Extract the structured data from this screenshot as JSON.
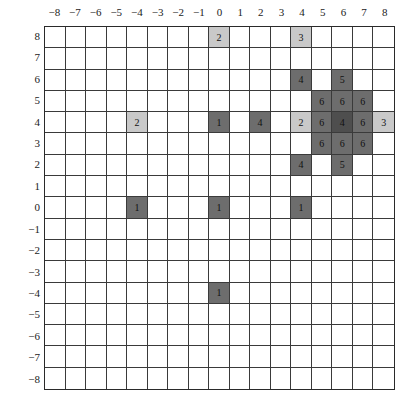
{
  "x_axis": {
    "ticks": [
      "−8",
      "−7",
      "−6",
      "−5",
      "−4",
      "−3",
      "−2",
      "−1",
      "0",
      "1",
      "2",
      "3",
      "4",
      "5",
      "6",
      "7",
      "8"
    ]
  },
  "y_axis": {
    "ticks": [
      "8",
      "7",
      "6",
      "5",
      "4",
      "3",
      "2",
      "1",
      "0",
      "−1",
      "−2",
      "−3",
      "−4",
      "−5",
      "−6",
      "−7",
      "−8"
    ]
  },
  "colors": {
    "light": "#c9c9c9",
    "dark": "#6d6d6d",
    "darker": "#4e4e4e",
    "empty": "#ffffff",
    "grid": "#3a3a3a"
  },
  "cells": [
    {
      "x": 0,
      "y": 8,
      "value": "2",
      "shade": "light"
    },
    {
      "x": 4,
      "y": 8,
      "value": "3",
      "shade": "light"
    },
    {
      "x": 4,
      "y": 6,
      "value": "4",
      "shade": "dark"
    },
    {
      "x": 6,
      "y": 6,
      "value": "5",
      "shade": "dark"
    },
    {
      "x": 5,
      "y": 5,
      "value": "6",
      "shade": "dark"
    },
    {
      "x": 6,
      "y": 5,
      "value": "6",
      "shade": "dark"
    },
    {
      "x": 7,
      "y": 5,
      "value": "6",
      "shade": "dark"
    },
    {
      "x": -4,
      "y": 4,
      "value": "2",
      "shade": "light"
    },
    {
      "x": 0,
      "y": 4,
      "value": "1",
      "shade": "dark"
    },
    {
      "x": 2,
      "y": 4,
      "value": "4",
      "shade": "dark"
    },
    {
      "x": 4,
      "y": 4,
      "value": "2",
      "shade": "light"
    },
    {
      "x": 5,
      "y": 4,
      "value": "6",
      "shade": "dark"
    },
    {
      "x": 6,
      "y": 4,
      "value": "4",
      "shade": "darker"
    },
    {
      "x": 7,
      "y": 4,
      "value": "6",
      "shade": "dark"
    },
    {
      "x": 8,
      "y": 4,
      "value": "3",
      "shade": "light"
    },
    {
      "x": 5,
      "y": 3,
      "value": "6",
      "shade": "dark"
    },
    {
      "x": 6,
      "y": 3,
      "value": "6",
      "shade": "dark"
    },
    {
      "x": 7,
      "y": 3,
      "value": "6",
      "shade": "dark"
    },
    {
      "x": 4,
      "y": 2,
      "value": "4",
      "shade": "dark"
    },
    {
      "x": 6,
      "y": 2,
      "value": "5",
      "shade": "dark"
    },
    {
      "x": -4,
      "y": 0,
      "value": "1",
      "shade": "dark"
    },
    {
      "x": 0,
      "y": 0,
      "value": "1",
      "shade": "dark"
    },
    {
      "x": 4,
      "y": 0,
      "value": "1",
      "shade": "dark"
    },
    {
      "x": 0,
      "y": -4,
      "value": "1",
      "shade": "dark"
    }
  ]
}
